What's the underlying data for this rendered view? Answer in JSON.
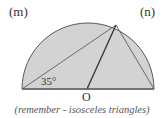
{
  "labels": {
    "left_label": "(m)",
    "right_label": "(n)",
    "center_label": "O",
    "angle_label": "35°"
  },
  "caption": "(remember - isosceles triangles)",
  "diagram": {
    "shape": "semicircle",
    "fill_color": "#d3d3d3",
    "stroke_color": "#555555",
    "segments": [
      "left-end to top point (chord)",
      "O to top point (radius)",
      "top point to right-end (chord)",
      "diameter"
    ],
    "given_angle": "35°"
  }
}
